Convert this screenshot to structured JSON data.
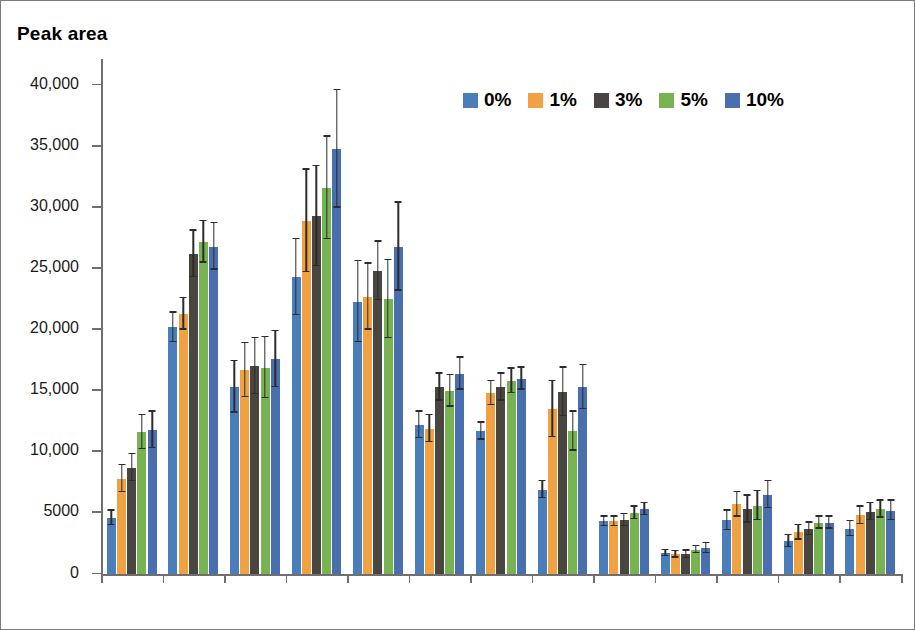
{
  "figure": {
    "axis_title": "Peak area",
    "border_color": "#7a7a7a",
    "background": "#ffffff"
  },
  "legend": {
    "position": "top-right",
    "items": [
      {
        "label": "0%",
        "color": "#4a7ebb"
      },
      {
        "label": "1%",
        "color": "#f0a243"
      },
      {
        "label": "3%",
        "color": "#494641"
      },
      {
        "label": "5%",
        "color": "#77b350"
      },
      {
        "label": "10%",
        "color": "#4a6fae"
      }
    ]
  },
  "yaxis": {
    "label": "Peak area",
    "ticks": [
      {
        "value": 0,
        "label": "0"
      },
      {
        "value": 5000,
        "label": "5000"
      },
      {
        "value": 10000,
        "label": "10,000"
      },
      {
        "value": 15000,
        "label": "15,000"
      },
      {
        "value": 20000,
        "label": "20,000"
      },
      {
        "value": 25000,
        "label": "25,000"
      },
      {
        "value": 30000,
        "label": "30,000"
      },
      {
        "value": 35000,
        "label": "35,000"
      },
      {
        "value": 40000,
        "label": "40,000"
      }
    ]
  },
  "chart_data": {
    "type": "bar",
    "title": "",
    "subtitle": "",
    "xlabel": "",
    "ylabel": "Peak area",
    "ylim": [
      0,
      42000
    ],
    "grid": false,
    "legend_position": "top-right",
    "error_bars": "standard deviation",
    "categories": [
      "DEET",
      "BPH",
      "PP",
      "BP",
      "4OP",
      "3MBC",
      "4NP",
      "DIC",
      "TRC",
      "BPA",
      "DES",
      "E2",
      "E1"
    ],
    "series": [
      {
        "name": "0%",
        "color": "#4a7ebb",
        "values": [
          4600,
          20200,
          15300,
          24300,
          22300,
          12200,
          11700,
          6900,
          4300,
          1700,
          4400,
          2700,
          3700
        ],
        "errors": [
          600,
          1200,
          2100,
          3100,
          3300,
          1100,
          700,
          700,
          400,
          250,
          800,
          500,
          600
        ]
      },
      {
        "name": "1%",
        "color": "#f0a243",
        "values": [
          7800,
          21300,
          16700,
          28900,
          22700,
          11900,
          14800,
          13500,
          4300,
          1600,
          5700,
          3400,
          4800
        ],
        "errors": [
          1100,
          1300,
          2200,
          4200,
          2700,
          1100,
          1000,
          2300,
          400,
          250,
          1000,
          600,
          700
        ]
      },
      {
        "name": "3%",
        "color": "#494641",
        "values": [
          8700,
          26200,
          17000,
          29300,
          24800,
          15300,
          15300,
          14900,
          4400,
          1600,
          5300,
          3700,
          5100
        ],
        "errors": [
          1100,
          1900,
          2300,
          4100,
          2400,
          1100,
          1100,
          2000,
          500,
          300,
          1100,
          500,
          700
        ]
      },
      {
        "name": "5%",
        "color": "#77b350",
        "values": [
          11600,
          27200,
          16900,
          31600,
          22500,
          15000,
          15800,
          11700,
          5000,
          2000,
          5600,
          4200,
          5300
        ],
        "errors": [
          1400,
          1700,
          2500,
          4200,
          3200,
          1300,
          1000,
          1600,
          500,
          300,
          1200,
          500,
          700
        ]
      },
      {
        "name": "10%",
        "color": "#4a6fae",
        "values": [
          11800,
          26800,
          17600,
          34800,
          26800,
          16400,
          16000,
          15300,
          5300,
          2100,
          6500,
          4200,
          5200
        ],
        "errors": [
          1500,
          1900,
          2300,
          4800,
          3600,
          1300,
          900,
          1800,
          500,
          400,
          1100,
          500,
          800
        ]
      }
    ]
  }
}
